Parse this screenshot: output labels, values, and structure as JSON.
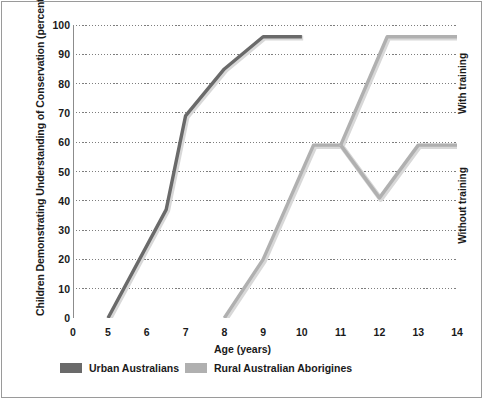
{
  "chart_data": {
    "type": "line",
    "title": "",
    "subtitle": "",
    "xlabel": "Age (years)",
    "ylabel": "Children Demonstrating Understanding of Conservation (percent)",
    "xlim": [
      0,
      14
    ],
    "ylim": [
      0,
      100
    ],
    "x_ticks": [
      0,
      5,
      6,
      7,
      8,
      9,
      10,
      11,
      12,
      13,
      14
    ],
    "x_tick_labels": [
      "0",
      "5",
      "6",
      "7",
      "8",
      "9",
      "10",
      "11",
      "12",
      "13",
      "14"
    ],
    "y_ticks": [
      0,
      10,
      20,
      30,
      40,
      50,
      60,
      70,
      80,
      90,
      100
    ],
    "y_tick_labels": [
      "0",
      "10",
      "20",
      "30",
      "40",
      "50",
      "60",
      "70",
      "80",
      "90",
      "100"
    ],
    "grid": "horizontal-dotted",
    "legend_position": "bottom-left",
    "note_axis_break": "x-axis compressed between 0 and 5",
    "series": [
      {
        "name": "Urban Australians",
        "color": "#6a6a6a",
        "points": [
          [
            5,
            0
          ],
          [
            6.5,
            37
          ],
          [
            7,
            69
          ],
          [
            8,
            85
          ],
          [
            9,
            96
          ],
          [
            10,
            96
          ]
        ]
      },
      {
        "name": "Rural Australian Aborigines",
        "color": "#b0b0b0",
        "points": [
          [
            8,
            0
          ],
          [
            9,
            20
          ],
          [
            10.3,
            59
          ],
          [
            11,
            59
          ]
        ],
        "branches": [
          {
            "label": "With training",
            "points": [
              [
                11,
                59
              ],
              [
                12.2,
                96
              ],
              [
                14,
                96
              ]
            ]
          },
          {
            "label": "Without training",
            "points": [
              [
                11,
                59
              ],
              [
                12,
                41
              ],
              [
                13,
                59
              ],
              [
                14,
                59
              ]
            ]
          }
        ]
      }
    ],
    "annotations": [
      {
        "text": "With training",
        "orientation": "vertical"
      },
      {
        "text": "Without training",
        "orientation": "vertical"
      }
    ]
  },
  "legend": {
    "items": [
      {
        "label": "Urban Australians",
        "color": "#6a6a6a"
      },
      {
        "label": "Rural Australian Aborigines",
        "color": "#b0b0b0"
      }
    ]
  },
  "colors": {
    "urban": "#6a6a6a",
    "rural": "#b0b0b0",
    "grid": "#7d7d7d",
    "axis": "#8c8c8c",
    "text": "#1a1a1a",
    "frame": "#9a9a9a"
  }
}
